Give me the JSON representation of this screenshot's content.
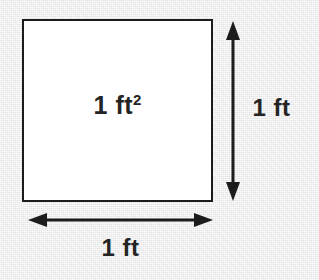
{
  "diagram": {
    "background_color": "#ececec",
    "stroke_color": "#1c1c1c",
    "fill_color": "#ffffff",
    "text_color": "#242424",
    "square": {
      "area_label_value": "1",
      "area_label_unit": " ft",
      "area_label_exponent": "2",
      "area_label_full": "1 ft2"
    },
    "height_dimension": {
      "label": "1 ft",
      "orientation": "vertical",
      "arrow_style": "double-headed"
    },
    "width_dimension": {
      "label": "1 ft",
      "orientation": "horizontal",
      "arrow_style": "double-headed"
    }
  }
}
